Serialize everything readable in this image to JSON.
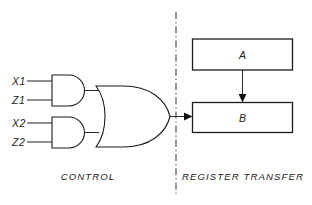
{
  "diagram": {
    "background_color": "#ffffff",
    "line_color": "#1c1c1c",
    "inputs": [
      {
        "name": "x1",
        "label": "X1"
      },
      {
        "name": "z1",
        "label": "Z1"
      },
      {
        "name": "x2",
        "label": "X2"
      },
      {
        "name": "z2",
        "label": "Z2"
      }
    ],
    "gates": [
      {
        "name": "and-gate-1",
        "type": "AND",
        "inputs": [
          "X1",
          "Z1"
        ]
      },
      {
        "name": "and-gate-2",
        "type": "AND",
        "inputs": [
          "X2",
          "Z2"
        ]
      },
      {
        "name": "or-gate",
        "type": "OR",
        "inputs": [
          "and-gate-1",
          "and-gate-2"
        ]
      }
    ],
    "registers": [
      {
        "name": "register-a",
        "label": "A"
      },
      {
        "name": "register-b",
        "label": "B"
      }
    ],
    "connections": [
      {
        "from": "register-a",
        "to": "register-b",
        "style": "arrow"
      },
      {
        "from": "or-gate",
        "to": "register-b",
        "style": "arrow"
      }
    ],
    "sections": [
      {
        "name": "control",
        "label": "CONTROL"
      },
      {
        "name": "register-transfer",
        "label": "REGISTER TRANSFER"
      }
    ],
    "divider": {
      "name": "section-divider",
      "style": "dash-dot",
      "orientation": "vertical"
    }
  }
}
